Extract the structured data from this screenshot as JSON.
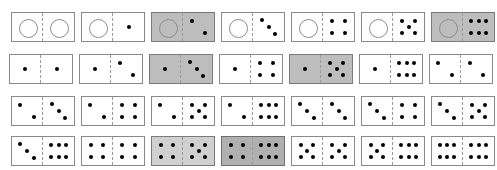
{
  "figure": {
    "rows": 4,
    "columns": 7,
    "total_tiles": 28,
    "blank_glyph": "open-circle",
    "pip_color": "#000000",
    "tile_fill": "#ffffff",
    "tile_border": "#8a8a8a",
    "shade_fill": "#bdbdbd",
    "shade_fill_light": "#d0d0d0",
    "shade_fill_dark": "#b0b0b0",
    "divider_style": "dashed"
  },
  "chart_data": {
    "type": "table",
    "xlabel": "",
    "ylabel": "",
    "legend": [
      {
        "label": "unshaded tile",
        "color": "#ffffff"
      },
      {
        "label": "shaded tile",
        "color": "#bdbdbd"
      }
    ],
    "categories": [
      "col-1",
      "col-2",
      "col-3",
      "col-4",
      "col-5",
      "col-6",
      "col-7"
    ],
    "rows": [
      {
        "row": 1,
        "tiles": [
          {
            "id": "0-0",
            "left": 0,
            "right": 0,
            "shaded": false,
            "shade": "none"
          },
          {
            "id": "0-1",
            "left": 0,
            "right": 1,
            "shaded": false,
            "shade": "none"
          },
          {
            "id": "0-2",
            "left": 0,
            "right": 2,
            "shaded": true,
            "shade": "medium"
          },
          {
            "id": "0-3",
            "left": 0,
            "right": 3,
            "shaded": false,
            "shade": "none"
          },
          {
            "id": "0-4",
            "left": 0,
            "right": 4,
            "shaded": false,
            "shade": "none"
          },
          {
            "id": "0-5",
            "left": 0,
            "right": 5,
            "shaded": false,
            "shade": "none"
          },
          {
            "id": "0-6",
            "left": 0,
            "right": 6,
            "shaded": true,
            "shade": "medium"
          }
        ]
      },
      {
        "row": 2,
        "tiles": [
          {
            "id": "1-1",
            "left": 1,
            "right": 1,
            "shaded": false,
            "shade": "none"
          },
          {
            "id": "1-2",
            "left": 1,
            "right": 2,
            "shaded": false,
            "shade": "none"
          },
          {
            "id": "1-3",
            "left": 1,
            "right": 3,
            "shaded": true,
            "shade": "medium"
          },
          {
            "id": "1-4",
            "left": 1,
            "right": 4,
            "shaded": false,
            "shade": "none"
          },
          {
            "id": "1-5",
            "left": 1,
            "right": 5,
            "shaded": true,
            "shade": "medium"
          },
          {
            "id": "1-6",
            "left": 1,
            "right": 6,
            "shaded": false,
            "shade": "none"
          },
          {
            "id": "2-2",
            "left": 2,
            "right": 2,
            "shaded": false,
            "shade": "none"
          }
        ]
      },
      {
        "row": 3,
        "tiles": [
          {
            "id": "2-3",
            "left": 2,
            "right": 3,
            "shaded": false,
            "shade": "none"
          },
          {
            "id": "2-4",
            "left": 2,
            "right": 4,
            "shaded": false,
            "shade": "none"
          },
          {
            "id": "2-5",
            "left": 2,
            "right": 5,
            "shaded": false,
            "shade": "none"
          },
          {
            "id": "2-6",
            "left": 2,
            "right": 6,
            "shaded": false,
            "shade": "none"
          },
          {
            "id": "3-3",
            "left": 3,
            "right": 3,
            "shaded": false,
            "shade": "none"
          },
          {
            "id": "3-4",
            "left": 3,
            "right": 4,
            "shaded": false,
            "shade": "none"
          },
          {
            "id": "3-5",
            "left": 3,
            "right": 5,
            "shaded": false,
            "shade": "none"
          }
        ]
      },
      {
        "row": 4,
        "tiles": [
          {
            "id": "3-6",
            "left": 3,
            "right": 6,
            "shaded": false,
            "shade": "none"
          },
          {
            "id": "4-4",
            "left": 4,
            "right": 4,
            "shaded": false,
            "shade": "none"
          },
          {
            "id": "4-5",
            "left": 4,
            "right": 5,
            "shaded": true,
            "shade": "light"
          },
          {
            "id": "4-6",
            "left": 4,
            "right": 6,
            "shaded": true,
            "shade": "dark"
          },
          {
            "id": "5-5",
            "left": 5,
            "right": 5,
            "shaded": false,
            "shade": "none"
          },
          {
            "id": "5-6",
            "left": 5,
            "right": 6,
            "shaded": false,
            "shade": "none"
          },
          {
            "id": "6-6",
            "left": 6,
            "right": 6,
            "shaded": false,
            "shade": "none"
          }
        ]
      }
    ],
    "pip_layouts": {
      "0": [],
      "1": [
        [
          50,
          50
        ]
      ],
      "2": [
        [
          28,
          28
        ],
        [
          72,
          72
        ]
      ],
      "3": [
        [
          28,
          26
        ],
        [
          50,
          50
        ],
        [
          72,
          74
        ]
      ],
      "4": [
        [
          30,
          28
        ],
        [
          70,
          28
        ],
        [
          30,
          72
        ],
        [
          70,
          72
        ]
      ],
      "5": [
        [
          30,
          28
        ],
        [
          70,
          28
        ],
        [
          50,
          50
        ],
        [
          30,
          72
        ],
        [
          70,
          72
        ]
      ],
      "6": [
        [
          26,
          27
        ],
        [
          50,
          27
        ],
        [
          74,
          27
        ],
        [
          26,
          73
        ],
        [
          50,
          73
        ],
        [
          74,
          73
        ]
      ]
    }
  }
}
